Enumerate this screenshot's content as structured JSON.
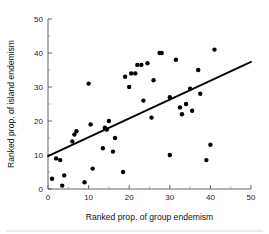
{
  "chart_data": {
    "type": "scatter",
    "title": "",
    "xlabel": "Ranked prop. of group endemism",
    "ylabel": "Ranked prop. of island endemism",
    "xlim": [
      0,
      50
    ],
    "ylim": [
      0,
      50
    ],
    "xticks": [
      0,
      10,
      20,
      30,
      40,
      50
    ],
    "xtick_labels": [
      "0",
      "10",
      "20",
      "30",
      "40",
      "50"
    ],
    "yticks": [
      0,
      10,
      20,
      30,
      40,
      50
    ],
    "ytick_labels": [
      "0",
      "10",
      "20",
      "30",
      "40",
      "50"
    ],
    "minor_tick_interval": 5,
    "grid": false,
    "legend": null,
    "marker": "filled-circle",
    "marker_color": "#000000",
    "points": [
      {
        "x": 1,
        "y": 3
      },
      {
        "x": 2,
        "y": 9
      },
      {
        "x": 3,
        "y": 8.5
      },
      {
        "x": 3.5,
        "y": 1
      },
      {
        "x": 4,
        "y": 4
      },
      {
        "x": 6,
        "y": 14
      },
      {
        "x": 6.5,
        "y": 16
      },
      {
        "x": 7,
        "y": 17
      },
      {
        "x": 9,
        "y": 2
      },
      {
        "x": 10,
        "y": 31
      },
      {
        "x": 10.5,
        "y": 19
      },
      {
        "x": 11,
        "y": 6
      },
      {
        "x": 13.5,
        "y": 12
      },
      {
        "x": 14,
        "y": 18
      },
      {
        "x": 14.5,
        "y": 17.5
      },
      {
        "x": 15,
        "y": 20
      },
      {
        "x": 16,
        "y": 11
      },
      {
        "x": 16.5,
        "y": 15
      },
      {
        "x": 18.5,
        "y": 5
      },
      {
        "x": 19,
        "y": 33
      },
      {
        "x": 20,
        "y": 30
      },
      {
        "x": 20.5,
        "y": 34
      },
      {
        "x": 21.5,
        "y": 34
      },
      {
        "x": 22,
        "y": 36.5
      },
      {
        "x": 23,
        "y": 36.5
      },
      {
        "x": 23.5,
        "y": 26
      },
      {
        "x": 24.5,
        "y": 37
      },
      {
        "x": 25.5,
        "y": 21
      },
      {
        "x": 26,
        "y": 32
      },
      {
        "x": 27.5,
        "y": 40
      },
      {
        "x": 28,
        "y": 40
      },
      {
        "x": 30,
        "y": 27
      },
      {
        "x": 30,
        "y": 10
      },
      {
        "x": 31.5,
        "y": 38
      },
      {
        "x": 32.5,
        "y": 24
      },
      {
        "x": 33,
        "y": 22
      },
      {
        "x": 34,
        "y": 25
      },
      {
        "x": 35,
        "y": 29.5
      },
      {
        "x": 35.5,
        "y": 23
      },
      {
        "x": 37,
        "y": 35
      },
      {
        "x": 37.5,
        "y": 28
      },
      {
        "x": 39,
        "y": 8.5
      },
      {
        "x": 40,
        "y": 13
      },
      {
        "x": 41,
        "y": 41
      }
    ],
    "fit_line": {
      "x0": 0,
      "y0": 9.7,
      "x1": 50,
      "y1": 37.4,
      "color": "#000000"
    }
  }
}
